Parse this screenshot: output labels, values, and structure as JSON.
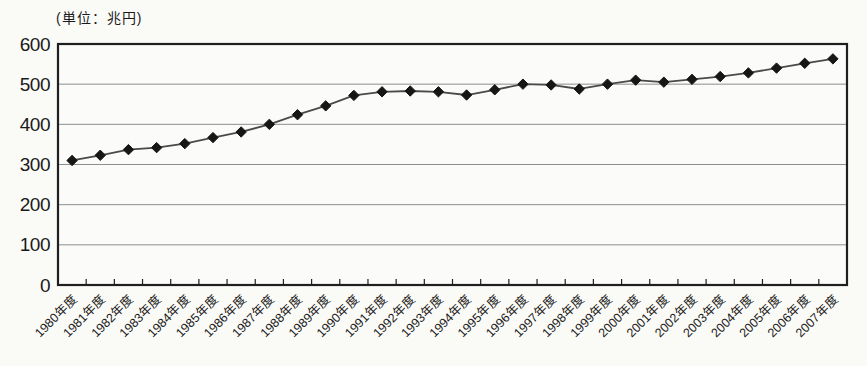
{
  "chart_data": {
    "type": "line",
    "title": "",
    "unit_label": "(単位：兆円)",
    "xlabel": "",
    "ylabel": "",
    "categories": [
      "1980年度",
      "1981年度",
      "1982年度",
      "1983年度",
      "1984年度",
      "1985年度",
      "1986年度",
      "1987年度",
      "1988年度",
      "1989年度",
      "1990年度",
      "1991年度",
      "1992年度",
      "1993年度",
      "1994年度",
      "1995年度",
      "1996年度",
      "1997年度",
      "1998年度",
      "1999年度",
      "2000年度",
      "2001年度",
      "2002年度",
      "2003年度",
      "2004年度",
      "2005年度",
      "2006年度",
      "2007年度"
    ],
    "values": [
      310,
      323,
      337,
      342,
      352,
      367,
      381,
      400,
      424,
      446,
      472,
      481,
      483,
      481,
      473,
      486,
      500,
      498,
      488,
      500,
      510,
      505,
      512,
      519,
      528,
      540,
      552,
      563
    ],
    "ylim": [
      0,
      600
    ],
    "yticks": [
      0,
      100,
      200,
      300,
      400,
      500,
      600
    ],
    "grid": true,
    "legend": "none",
    "marker": "diamond",
    "colors": {
      "background": "#fafaf7",
      "plot_background": "#fbfbf9",
      "axis": "#1f1f1f",
      "grid": "#8e8e8e",
      "line": "#4a4a4a",
      "marker": "#161616",
      "text": "#1a1a1a"
    }
  }
}
